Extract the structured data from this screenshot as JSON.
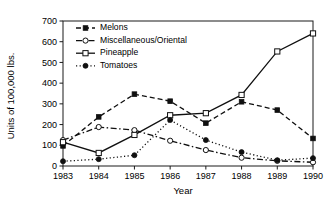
{
  "chart_data": {
    "type": "line",
    "title": "",
    "xlabel": "Year",
    "ylabel": "Units of 100,000 lbs.",
    "categories": [
      "1983",
      "1984",
      "1985",
      "1986",
      "1987",
      "1988",
      "1989",
      "1990"
    ],
    "x": [
      1983,
      1984,
      1985,
      1986,
      1987,
      1988,
      1989,
      1990
    ],
    "xlim": [
      1983,
      1990
    ],
    "ylim": [
      0,
      700
    ],
    "yticks": [
      0,
      100,
      200,
      300,
      400,
      500,
      600,
      700
    ],
    "ytick_labels": [
      "0",
      "100",
      "200",
      "300",
      "400",
      "500",
      "600",
      "700"
    ],
    "grid": false,
    "legend_position": "top-left",
    "series": [
      {
        "name": "Melons",
        "values": [
          97,
          237,
          347,
          313,
          207,
          310,
          270,
          133
        ],
        "line_style": "dashed",
        "marker": "filled-square"
      },
      {
        "name": "Miscellaneous/Oriental",
        "values": [
          125,
          188,
          173,
          122,
          77,
          40,
          25,
          18
        ],
        "line_style": "dash-dot",
        "marker": "open-circle"
      },
      {
        "name": "Pineapple",
        "values": [
          115,
          63,
          150,
          245,
          255,
          343,
          553,
          640
        ],
        "line_style": "solid",
        "marker": "open-square"
      },
      {
        "name": "Tomatoes",
        "values": [
          23,
          33,
          52,
          222,
          125,
          67,
          28,
          38
        ],
        "line_style": "dotted",
        "marker": "filled-circle"
      }
    ]
  },
  "colors": {
    "ink": "#101010",
    "background": "#ffffff"
  }
}
